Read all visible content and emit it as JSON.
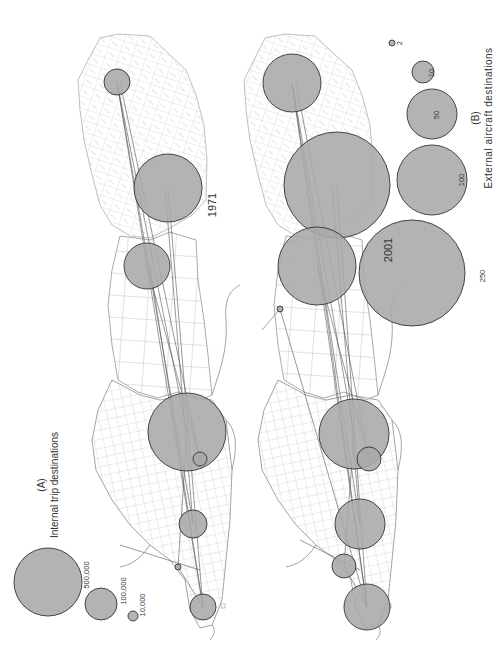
{
  "figure": {
    "panel_a": {
      "label": "(A)",
      "title": "Internal trip destinations",
      "legend": [
        {
          "value_label": "500,000",
          "cx": 48,
          "cy": 582,
          "r": 34
        },
        {
          "value_label": "100,000",
          "cx": 101,
          "cy": 604,
          "r": 16
        },
        {
          "value_label": "10,000",
          "cx": 133,
          "cy": 616,
          "r": 5
        }
      ]
    },
    "panel_b": {
      "label": "(B)",
      "title": "External aircraft destinations",
      "legend": [
        {
          "value_label": "250",
          "cx": 412,
          "cy": 273,
          "r": 53
        },
        {
          "value_label": "100",
          "cx": 432,
          "cy": 180,
          "r": 35
        },
        {
          "value_label": "50",
          "cx": 432,
          "cy": 114,
          "r": 25
        },
        {
          "value_label": "10",
          "cx": 423,
          "cy": 72,
          "r": 11
        },
        {
          "value_label": "2",
          "cx": 392,
          "cy": 43,
          "r": 3
        }
      ]
    },
    "maps": [
      {
        "year_label": "1971",
        "year_x": 212,
        "year_y": 202,
        "circles": [
          {
            "cx": 117,
            "cy": 82,
            "r": 13
          },
          {
            "cx": 168,
            "cy": 188,
            "r": 34
          },
          {
            "cx": 147,
            "cy": 266,
            "r": 23
          },
          {
            "cx": 187,
            "cy": 432,
            "r": 39
          },
          {
            "cx": 200,
            "cy": 459,
            "r": 7
          },
          {
            "cx": 193,
            "cy": 524,
            "r": 14
          },
          {
            "cx": 178,
            "cy": 567,
            "r": 3
          },
          {
            "cx": 203,
            "cy": 607,
            "r": 13
          }
        ]
      },
      {
        "year_label": "2001",
        "year_x": 392,
        "year_y": 250,
        "circles": [
          {
            "cx": 292,
            "cy": 83,
            "r": 29
          },
          {
            "cx": 337,
            "cy": 185,
            "r": 53
          },
          {
            "cx": 317,
            "cy": 266,
            "r": 39
          },
          {
            "cx": 354,
            "cy": 434,
            "r": 35
          },
          {
            "cx": 369,
            "cy": 459,
            "r": 12
          },
          {
            "cx": 360,
            "cy": 524,
            "r": 25
          },
          {
            "cx": 344,
            "cy": 566,
            "r": 12
          },
          {
            "cx": 367,
            "cy": 607,
            "r": 23
          },
          {
            "cx": 280,
            "cy": 309,
            "r": 3
          }
        ]
      }
    ],
    "colors": {
      "circle_fill": "#a9a9a9",
      "circle_stroke": "#333333",
      "boundary": "#b8b8b8",
      "coast": "#8c8c8c",
      "flow_line": "#555555"
    }
  }
}
